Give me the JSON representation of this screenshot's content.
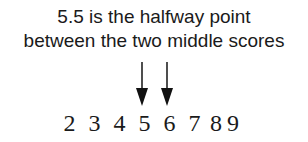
{
  "caption": {
    "line1": "5.5 is the halfway point",
    "line2": "between the two middle scores"
  },
  "scores": [
    "2",
    "3",
    "4",
    "5",
    "6",
    "7",
    "8",
    "9"
  ],
  "arrows": [
    {
      "points_to": "5",
      "x": 142
    },
    {
      "points_to": "6",
      "x": 167
    }
  ],
  "colors": {
    "text": "#1a1a1a",
    "arrow": "#111111",
    "background": "#ffffff"
  }
}
